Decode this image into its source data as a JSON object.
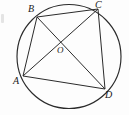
{
  "figure": {
    "kind": "euclidean-geometry-diagram",
    "background_color": "#fdfdfd",
    "stroke_color": "#2b2b2b",
    "label_color": "#1a1a1a",
    "stroke_width": 1
  },
  "circle": {
    "name": "circumcircle",
    "center": {
      "x": 69,
      "y": 56.5
    },
    "radius": 52
  },
  "points": [
    {
      "id": "A",
      "label": "A",
      "x": 23,
      "y": 76,
      "label_x": 13,
      "label_y": 76,
      "on_circle": true
    },
    {
      "id": "B",
      "label": "B",
      "x": 37,
      "y": 17,
      "label_x": 28,
      "label_y": 4,
      "on_circle": true
    },
    {
      "id": "C",
      "label": "C",
      "x": 98,
      "y": 9,
      "label_x": 95,
      "label_y": 0,
      "on_circle": true
    },
    {
      "id": "D",
      "label": "D",
      "x": 105,
      "y": 89,
      "label_x": 105,
      "label_y": 90,
      "on_circle": true
    },
    {
      "id": "O",
      "label": "O",
      "x": 62,
      "y": 44,
      "label_x": 57,
      "label_y": 45,
      "on_circle": false
    }
  ],
  "segments": [
    {
      "id": "AB",
      "from": "A",
      "to": "B",
      "role": "side"
    },
    {
      "id": "BC",
      "from": "B",
      "to": "C",
      "role": "side"
    },
    {
      "id": "CD",
      "from": "C",
      "to": "D",
      "role": "side"
    },
    {
      "id": "AD",
      "from": "A",
      "to": "D",
      "role": "side"
    },
    {
      "id": "AC",
      "from": "A",
      "to": "C",
      "role": "diagonal"
    },
    {
      "id": "BD",
      "from": "B",
      "to": "D",
      "role": "diagonal"
    }
  ],
  "labels": {
    "A": "A",
    "B": "B",
    "C": "C",
    "D": "D",
    "O": "O"
  }
}
